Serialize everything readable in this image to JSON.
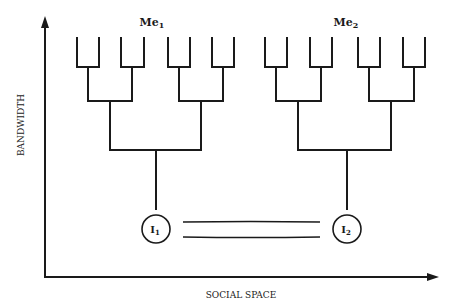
{
  "diagram": {
    "axes": {
      "y_label": "BANDWIDTH",
      "x_label": "SOCIAL SPACE"
    },
    "trees": [
      {
        "label": "Me",
        "subscript": "1",
        "leaf_count": 8,
        "root_node": {
          "label": "I",
          "subscript": "1"
        }
      },
      {
        "label": "Me",
        "subscript": "2",
        "leaf_count": 8,
        "root_node": {
          "label": "I",
          "subscript": "2"
        }
      }
    ],
    "connection": {
      "type": "double-line",
      "from": "I1",
      "to": "I2"
    },
    "colors": {
      "ink": "#1a1a1a",
      "background": "#ffffff"
    }
  }
}
